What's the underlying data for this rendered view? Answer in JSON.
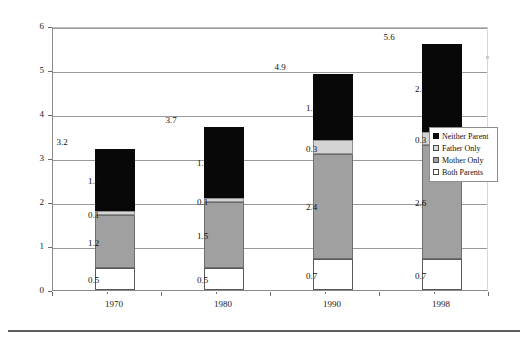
{
  "chart_data": {
    "type": "bar",
    "subtype": "stacked-bar",
    "title": "",
    "xlabel": "",
    "ylabel": "Percent of children under 18",
    "categories": [
      "1970",
      "1980",
      "1990",
      "1998"
    ],
    "ylim": [
      0,
      6
    ],
    "yticks": [
      0,
      1,
      2,
      3,
      4,
      5,
      6
    ],
    "ytick_labels": [
      "0",
      "1",
      "2",
      "3",
      "4",
      "5",
      "6"
    ],
    "grid": true,
    "grid_axis": "y",
    "legend_position": "right-middle",
    "stack_order_bottom_to_top": [
      "Both Parents",
      "Mother Only",
      "Father Only",
      "Neither Parent"
    ],
    "series": [
      {
        "name": "Both Parents",
        "color": "#ffffff",
        "values": [
          0.5,
          0.5,
          0.7,
          0.7
        ]
      },
      {
        "name": "Mother Only",
        "color": "#a0a0a0",
        "values": [
          1.2,
          1.5,
          2.4,
          2.6
        ]
      },
      {
        "name": "Father Only",
        "color": "#d4d4d4",
        "values": [
          0.1,
          0.1,
          0.3,
          0.3
        ]
      },
      {
        "name": "Neither Parent",
        "color": "#080808",
        "values": [
          1.4,
          1.6,
          1.5,
          2.0
        ]
      }
    ],
    "totals": [
      3.2,
      3.7,
      4.9,
      5.6
    ],
    "total_labels": [
      "3.2",
      "3.7",
      "4.9",
      "5.6"
    ],
    "segment_labels": {
      "1970": {
        "both": "0.5",
        "mother": "1.2",
        "father": "0.1",
        "neither": "1.4"
      },
      "1980": {
        "both": "0.5",
        "mother": "1.5",
        "father": "0.1",
        "neither": "1.6"
      },
      "1990": {
        "both": "0.7",
        "mother": "2.4",
        "father": "0.3",
        "neither": "1.5"
      },
      "1998": {
        "both": "0.7",
        "mother": "2.6",
        "father": "0.3",
        "neither": "2.0"
      }
    }
  },
  "legend": {
    "items": [
      {
        "label": "Neither Parent",
        "swatch": "sw-neither"
      },
      {
        "label": "Father Only",
        "swatch": "sw-father"
      },
      {
        "label": "Mother Only",
        "swatch": "sw-mother"
      },
      {
        "label": "Both Parents",
        "swatch": "sw-both"
      }
    ]
  },
  "axis": {
    "y_title": "Percent of children under 18"
  }
}
